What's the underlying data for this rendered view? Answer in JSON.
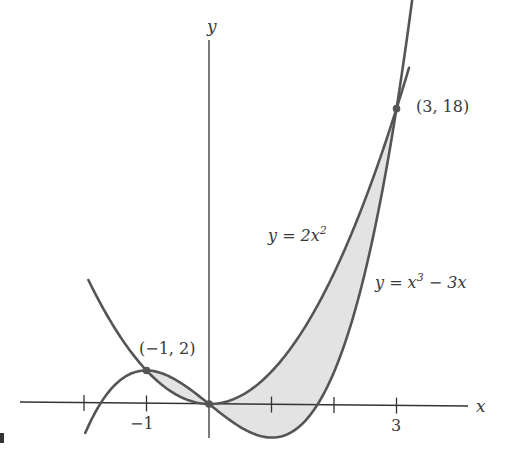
{
  "figure": {
    "axes": {
      "x_label": "x",
      "y_label": "y",
      "x_ticks": [
        -2,
        -1,
        1,
        2,
        3
      ],
      "x_tick_labels": [
        {
          "value": -1,
          "text": "−1"
        },
        {
          "value": 3,
          "text": "3"
        }
      ]
    },
    "curves": [
      {
        "name": "parabola",
        "equation": "y = 2x^2",
        "label_prefix": "y = 2x",
        "label_exp": "2"
      },
      {
        "name": "cubic",
        "equation": "y = x^3 - 3x",
        "label_prefix": "y = x",
        "label_exp": "3",
        "label_suffix": " − 3x"
      }
    ],
    "points": [
      {
        "x": -1,
        "y": 2,
        "label": "(−1, 2)"
      },
      {
        "x": 3,
        "y": 18,
        "label": "(3, 18)"
      }
    ],
    "shaded_region": "area between y = 2x^2 and y = x^3 - 3x from x = -1 to x = 3",
    "colors": {
      "stroke": "#555555",
      "fill": "#e3e3e3",
      "axis": "#333333",
      "text": "#3a3a3a"
    }
  }
}
